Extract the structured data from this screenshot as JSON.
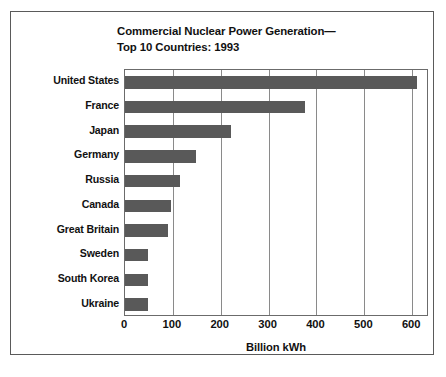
{
  "chart_data": {
    "type": "bar",
    "orientation": "horizontal",
    "title": "Commercial Nuclear Power Generation— Top 10 Countries: 1993",
    "title_lines": [
      "Commercial Nuclear Power Generation—",
      "Top 10 Countries: 1993"
    ],
    "xlabel": "Billion kWh",
    "ylabel": "",
    "categories": [
      "United States",
      "France",
      "Japan",
      "Germany",
      "Russia",
      "Canada",
      "Great Britain",
      "Sweden",
      "South Korea",
      "Ukraine"
    ],
    "values": [
      610,
      375,
      222,
      148,
      115,
      97,
      90,
      49,
      49,
      49
    ],
    "xlim": [
      0,
      635
    ],
    "xticks": [
      0,
      100,
      200,
      300,
      400,
      500,
      600
    ],
    "xtick_labels": [
      "0",
      "100",
      "200",
      "300",
      "400",
      "500",
      "600"
    ],
    "grid": "vertical",
    "legend": "none",
    "bar_color": "#595959",
    "grid_color": "#8a8a8a",
    "frame_color": "#6b6b6b",
    "background": "#ffffff"
  }
}
